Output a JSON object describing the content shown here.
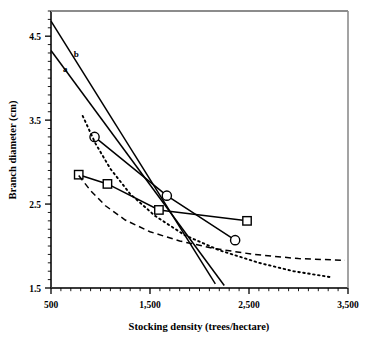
{
  "chart_data": {
    "type": "line",
    "title": "",
    "xlabel": "Stocking density (trees/hectare)",
    "ylabel": "Branch diameter (cm)",
    "xlim": [
      500,
      3500
    ],
    "ylim": [
      1.5,
      4.8
    ],
    "xticks": [
      500,
      1500,
      2500,
      3500
    ],
    "xtick_labels": [
      "500",
      "1,500",
      "2,500",
      "3,500"
    ],
    "yticks": [
      1.5,
      2.5,
      3.5,
      4.5
    ],
    "ytick_labels": [
      "1.5",
      "2.5",
      "3.5",
      "4.5"
    ],
    "grid": false,
    "legend": "none",
    "minor_ticks": true,
    "annotations": [
      {
        "text": "a",
        "x": 620,
        "y": 4.07
      },
      {
        "text": "b",
        "x": 730,
        "y": 4.25
      }
    ],
    "series": [
      {
        "name": "a",
        "style": "solid-line",
        "marker": "none",
        "x": [
          500,
          2250
        ],
        "values": [
          4.33,
          1.53
        ]
      },
      {
        "name": "b",
        "style": "solid-line",
        "marker": "none",
        "x": [
          500,
          2160
        ],
        "values": [
          4.68,
          1.55
        ]
      },
      {
        "name": "square-series",
        "style": "solid-line",
        "marker": "open-square",
        "x": [
          780,
          1070,
          1590,
          2480
        ],
        "values": [
          2.85,
          2.74,
          2.43,
          2.3
        ]
      },
      {
        "name": "circle-series",
        "style": "solid-line",
        "marker": "open-circle",
        "x": [
          940,
          1670,
          2360
        ],
        "values": [
          3.3,
          2.6,
          2.07
        ]
      },
      {
        "name": "dotted-curve",
        "style": "dotted-line",
        "marker": "none",
        "x": [
          820,
          950,
          1100,
          1300,
          1550,
          1850,
          2200,
          2600,
          2950,
          3320
        ],
        "values": [
          3.55,
          3.22,
          2.92,
          2.62,
          2.36,
          2.13,
          1.95,
          1.8,
          1.7,
          1.63
        ]
      },
      {
        "name": "dashed-curve",
        "style": "dashed-line",
        "marker": "none",
        "x": [
          780,
          900,
          1050,
          1250,
          1500,
          1800,
          2150,
          2550,
          3000,
          3470
        ],
        "values": [
          2.84,
          2.66,
          2.48,
          2.31,
          2.17,
          2.06,
          1.97,
          1.9,
          1.85,
          1.83
        ]
      }
    ]
  }
}
